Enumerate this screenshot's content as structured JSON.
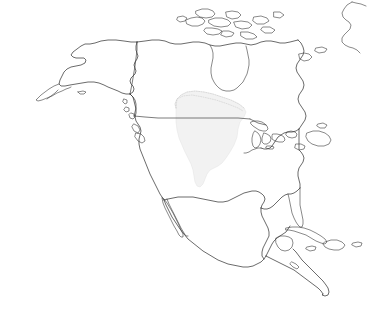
{
  "map": {
    "title": "North America outline map",
    "projection_note": "continental outline, unlabeled",
    "background_color": "#ffffff",
    "coastline_color": "#2b2b2b",
    "border_color": "#343434",
    "highlight_fill": "#f2f2f2",
    "highlight_outline": "#c9c9c9",
    "width": 378,
    "height": 321
  },
  "landmasses": [
    {
      "name": "alaska",
      "label": "Alaska"
    },
    {
      "name": "aleutian-islands",
      "label": "Aleutian Islands"
    },
    {
      "name": "canada-mainland",
      "label": "Canada"
    },
    {
      "name": "canadian-arctic-archipelago",
      "label": "Canadian Arctic Archipelago"
    },
    {
      "name": "greenland-west-coast",
      "label": "Greenland"
    },
    {
      "name": "united-states-mainland",
      "label": "United States"
    },
    {
      "name": "baja-california",
      "label": "Baja California"
    },
    {
      "name": "mexico",
      "label": "Mexico"
    },
    {
      "name": "central-america",
      "label": "Central America"
    },
    {
      "name": "cuba",
      "label": "Cuba"
    },
    {
      "name": "hispaniola",
      "label": "Hispaniola"
    },
    {
      "name": "jamaica",
      "label": "Jamaica"
    },
    {
      "name": "puerto-rico",
      "label": "Puerto Rico"
    },
    {
      "name": "newfoundland",
      "label": "Newfoundland"
    },
    {
      "name": "vancouver-island",
      "label": "Vancouver Island"
    },
    {
      "name": "great-lakes",
      "label": "Great Lakes"
    },
    {
      "name": "florida-peninsula",
      "label": "Florida"
    },
    {
      "name": "yucatan-peninsula",
      "label": "Yucatán Peninsula"
    }
  ],
  "borders": [
    {
      "name": "usa-canada-49th-parallel",
      "label": "United States – Canada border"
    },
    {
      "name": "alaska-canada-border",
      "label": "Alaska – Canada border"
    }
  ],
  "highlight": {
    "name": "central-plains-highlight",
    "label": "Highlighted region – central plains / Mississippi basin",
    "fill": "#f2f2f2",
    "visible": true
  }
}
